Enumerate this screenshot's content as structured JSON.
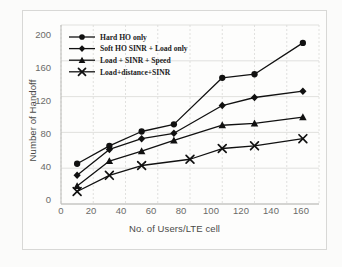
{
  "chart_data": {
    "type": "line",
    "title": "",
    "xlabel": "No. of Users/LTE cell",
    "ylabel": "Number of Handoff",
    "xlim": [
      0,
      160
    ],
    "ylim": [
      0,
      200
    ],
    "xticks": [
      0,
      20,
      40,
      60,
      80,
      100,
      120,
      140,
      160
    ],
    "yticks": [
      0,
      40,
      80,
      120,
      160,
      200
    ],
    "grid": true,
    "legend_position": "top-left",
    "series": [
      {
        "name": "Hard HO only",
        "marker": "circle",
        "x": [
          10,
          30,
          50,
          70,
          100,
          120,
          150
        ],
        "values": [
          45,
          65,
          81,
          89,
          141,
          145,
          180
        ]
      },
      {
        "name": "Soft HO SINR + Load only",
        "marker": "diamond",
        "x": [
          10,
          30,
          50,
          70,
          100,
          120,
          150
        ],
        "values": [
          32,
          61,
          73,
          79,
          110,
          119,
          126
        ]
      },
      {
        "name": "Load + SINR + Speed",
        "marker": "triangle",
        "x": [
          10,
          30,
          50,
          70,
          100,
          120,
          150
        ],
        "values": [
          20,
          48,
          59,
          71,
          88,
          90,
          97
        ]
      },
      {
        "name": "Load+distance+SINR",
        "marker": "x",
        "x": [
          10,
          30,
          50,
          80,
          100,
          120,
          150
        ],
        "values": [
          14,
          32,
          43,
          50,
          62,
          65,
          73
        ]
      }
    ]
  },
  "legend": {
    "items": [
      {
        "label": "Hard HO only",
        "marker": "circle"
      },
      {
        "label": "Soft HO SINR + Load only",
        "marker": "diamond"
      },
      {
        "label": "Load + SINR + Speed",
        "marker": "triangle"
      },
      {
        "label": "Load+distance+SINR",
        "marker": "x"
      }
    ]
  },
  "colors": {
    "series": "#111111",
    "grid": "#d9d9d7",
    "axis": "#b9b9b6",
    "tick_text": "#6b6b68",
    "title_text": "#4a4a48",
    "figure_border": "#d8d8d6",
    "page_background": "#fbfbfa",
    "plot_background": "#fdfdfc"
  }
}
